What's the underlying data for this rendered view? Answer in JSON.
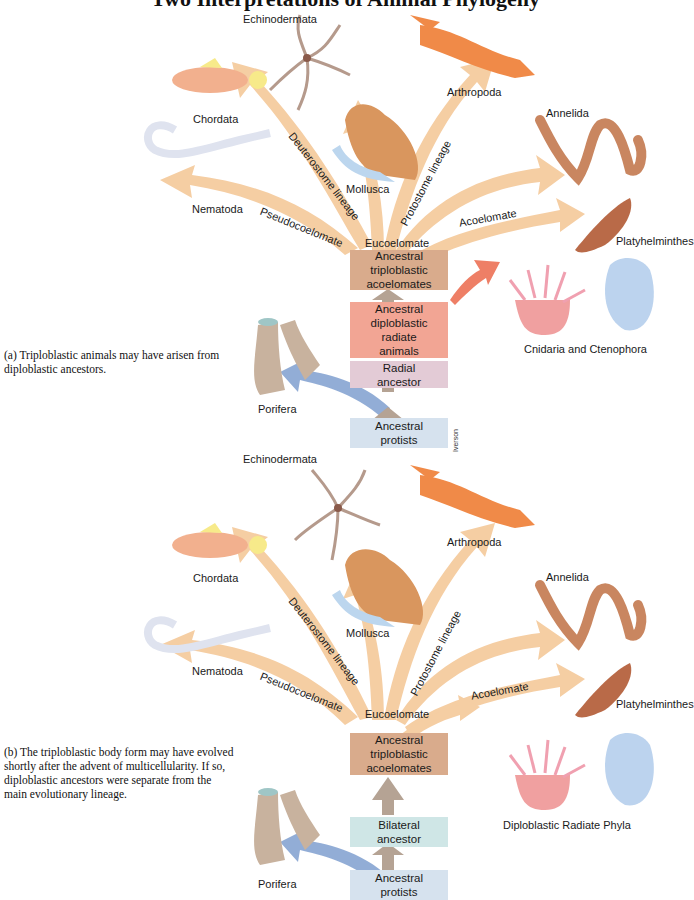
{
  "title": "Two Interpretations of Animal Phylogeny",
  "panels": [
    {
      "id": "a",
      "caption": "(a) Triploblastic animals may have arisen from diploblastic ancestors.",
      "taxa": {
        "echinodermata": "Echinodermata",
        "arthropoda": "Arthropoda",
        "chordata": "Chordata",
        "mollusca": "Mollusca",
        "annelida": "Annelida",
        "nematoda": "Nematoda",
        "platyhelminthes": "Platyhelminthes",
        "radiates": "Cnidaria and Ctenophora",
        "porifera": "Porifera"
      },
      "branches": {
        "deuterostome": "Deuterostome lineage",
        "protostome": "Protostome lineage",
        "pseudocoelomate": "Pseudocoelomate",
        "acoelomate": "Acoelomate",
        "eucoelomate": "Eucoelomate"
      },
      "boxes": [
        {
          "lines": [
            "Ancestral",
            "triploblastic",
            "acoelomates"
          ],
          "color": "#d9ab8c"
        },
        {
          "lines": [
            "Ancestral",
            "diploblastic",
            "radiate",
            "animals"
          ],
          "color": "#f2a594"
        },
        {
          "lines": [
            "Radial",
            "ancestor"
          ],
          "color": "#e3cbd6"
        },
        {
          "lines": [
            "Ancestral",
            "protists"
          ],
          "color": "#d6e2ee"
        }
      ],
      "credit": "Iverson"
    },
    {
      "id": "b",
      "caption": "(b) The triploblastic body form may have evolved shortly after the advent of multicellularity. If so, diploblastic ancestors were separate from the main evolutionary lineage.",
      "taxa": {
        "echinodermata": "Echinodermata",
        "arthropoda": "Arthropoda",
        "chordata": "Chordata",
        "mollusca": "Mollusca",
        "annelida": "Annelida",
        "nematoda": "Nematoda",
        "platyhelminthes": "Platyhelminthes",
        "radiates": "Diploblastic Radiate Phyla",
        "porifera": "Porifera"
      },
      "branches": {
        "deuterostome": "Deuterostome lineage",
        "protostome": "Protostome lineage",
        "pseudocoelomate": "Pseudocoelomate",
        "acoelomate": "Acoelomate",
        "eucoelomate": "Eucoelomate"
      },
      "boxes": [
        {
          "lines": [
            "Ancestral",
            "triploblastic",
            "acoelomates"
          ],
          "color": "#d9ab8c"
        },
        {
          "lines": [
            "Bilateral",
            "ancestor"
          ],
          "color": "#cfe6e6"
        },
        {
          "lines": [
            "Ancestral",
            "protists"
          ],
          "color": "#d6e2ee"
        }
      ]
    }
  ],
  "colors": {
    "branch_arrow": "#f5c99a",
    "stem_arrow": "#b5a394",
    "radiate_arrow": "#ee7f66",
    "porifera_arrow": "#7f9fcf"
  }
}
